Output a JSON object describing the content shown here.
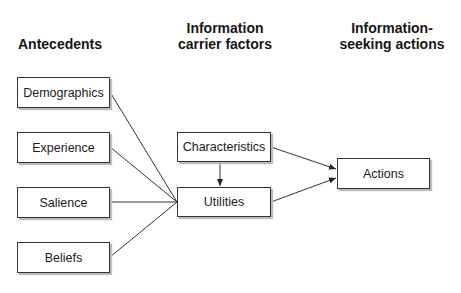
{
  "headers": {
    "antecedents": "Antecedents",
    "carrier_line1": "Information",
    "carrier_line2": "carrier factors",
    "actions_line1": "Information-",
    "actions_line2": "seeking actions"
  },
  "nodes": {
    "demographics": "Demographics",
    "experience": "Experience",
    "salience": "Salience",
    "beliefs": "Beliefs",
    "characteristics": "Characteristics",
    "utilities": "Utilities",
    "actions": "Actions"
  },
  "edges": [
    {
      "from": "Demographics",
      "to": "Utilities"
    },
    {
      "from": "Experience",
      "to": "Utilities"
    },
    {
      "from": "Salience",
      "to": "Utilities"
    },
    {
      "from": "Beliefs",
      "to": "Utilities"
    },
    {
      "from": "Characteristics",
      "to": "Utilities",
      "arrow": true
    },
    {
      "from": "Characteristics",
      "to": "Actions",
      "arrow": true
    },
    {
      "from": "Utilities",
      "to": "Actions",
      "arrow": true
    }
  ]
}
